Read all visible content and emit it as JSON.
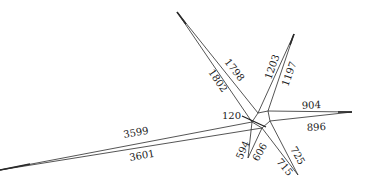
{
  "diagram": {
    "type": "radial-wedge-diagram",
    "center_label": "120",
    "spokes": [
      {
        "id": "upper-left",
        "labels": [
          "1798",
          "1802"
        ]
      },
      {
        "id": "upper-right",
        "labels": [
          "1203",
          "1197"
        ]
      },
      {
        "id": "right",
        "labels": [
          "904",
          "896"
        ]
      },
      {
        "id": "lower-left",
        "labels": [
          "3599",
          "3601"
        ]
      },
      {
        "id": "lower",
        "labels": [
          "594",
          "606"
        ]
      },
      {
        "id": "lower-right",
        "labels": [
          "725",
          "715"
        ]
      }
    ],
    "colors": {
      "line": "#2a2a2a",
      "text": "#222222",
      "background": "#ffffff"
    }
  }
}
